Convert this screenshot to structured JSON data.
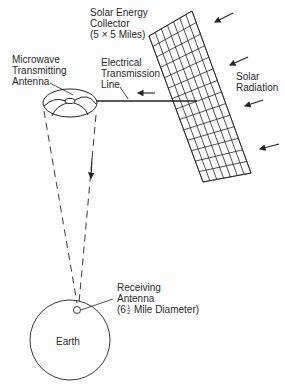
{
  "diagram": {
    "stroke_color": "#222222",
    "labels": {
      "collector": [
        "Solar Energy",
        "Collector",
        "(5 × 5 Miles)"
      ],
      "transmitter": [
        "Microwave",
        "Transmitting",
        "Antenna"
      ],
      "transmission_line": [
        "Electrical",
        "Transmission",
        "Line"
      ],
      "solar_radiation": [
        "Solar",
        "Radiation"
      ],
      "receiver": [
        "Receiving",
        "Antenna"
      ],
      "receiver_diameter_prefix": "(6",
      "receiver_diameter_frac_num": "1",
      "receiver_diameter_frac_den": "2",
      "receiver_diameter_suffix": "Mile Diameter)",
      "earth": "Earth"
    },
    "components": [
      {
        "id": "solar-collector",
        "shape": "grid-panel",
        "rows": 14,
        "cols": 7
      },
      {
        "id": "microwave-antenna",
        "shape": "ellipse"
      },
      {
        "id": "transmission-line",
        "shape": "line"
      },
      {
        "id": "microwave-beam",
        "shape": "dashed-cone"
      },
      {
        "id": "earth",
        "shape": "circle"
      },
      {
        "id": "receiving-antenna",
        "shape": "small-circle"
      }
    ],
    "arrows": [
      {
        "id": "solar-radiation-1",
        "direction": "down-left"
      },
      {
        "id": "solar-radiation-2",
        "direction": "down-left"
      },
      {
        "id": "solar-radiation-3",
        "direction": "down-left"
      },
      {
        "id": "solar-radiation-4",
        "direction": "down-left"
      },
      {
        "id": "power-flow",
        "direction": "left"
      },
      {
        "id": "beam-direction",
        "direction": "down"
      }
    ]
  }
}
